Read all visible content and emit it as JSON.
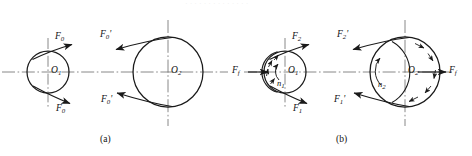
{
  "figure": {
    "caption_a": "(a)",
    "caption_b": "(b)",
    "top_artifact": "· · ·  · · · ·  ·  · · · · · ·",
    "colors": {
      "stroke": "#1a1a1a",
      "centerline": "#6b6b6b",
      "background": "#ffffff"
    }
  },
  "panel_a": {
    "name": "(a)",
    "small_pulley": {
      "center_label": "O",
      "center_sub": "1",
      "force_top": {
        "label": "F",
        "sub": "0",
        "prime": ""
      },
      "force_bottom": {
        "label": "F",
        "sub": "0",
        "prime": ""
      }
    },
    "large_pulley": {
      "center_label": "O",
      "center_sub": "2",
      "force_top": {
        "label": "F",
        "sub": "0",
        "prime": "'"
      },
      "force_bottom": {
        "label": "F",
        "sub": "0",
        "prime": "'"
      }
    }
  },
  "panel_b": {
    "name": "(b)",
    "small_pulley": {
      "center_label": "O",
      "center_sub": "1",
      "rotation_label": "n",
      "rotation_sub": "1",
      "force_top": {
        "label": "F",
        "sub": "2",
        "prime": ""
      },
      "force_bottom": {
        "label": "F",
        "sub": "1",
        "prime": ""
      },
      "friction_force": {
        "label": "F",
        "sub": "f",
        "prime": ""
      }
    },
    "large_pulley": {
      "center_label": "O",
      "center_sub": "2",
      "rotation_label": "n",
      "rotation_sub": "2",
      "force_top": {
        "label": "F",
        "sub": "2",
        "prime": "'"
      },
      "force_bottom": {
        "label": "F",
        "sub": "1",
        "prime": "'"
      },
      "friction_force": {
        "label": "F",
        "sub": "f",
        "prime": ""
      }
    }
  }
}
